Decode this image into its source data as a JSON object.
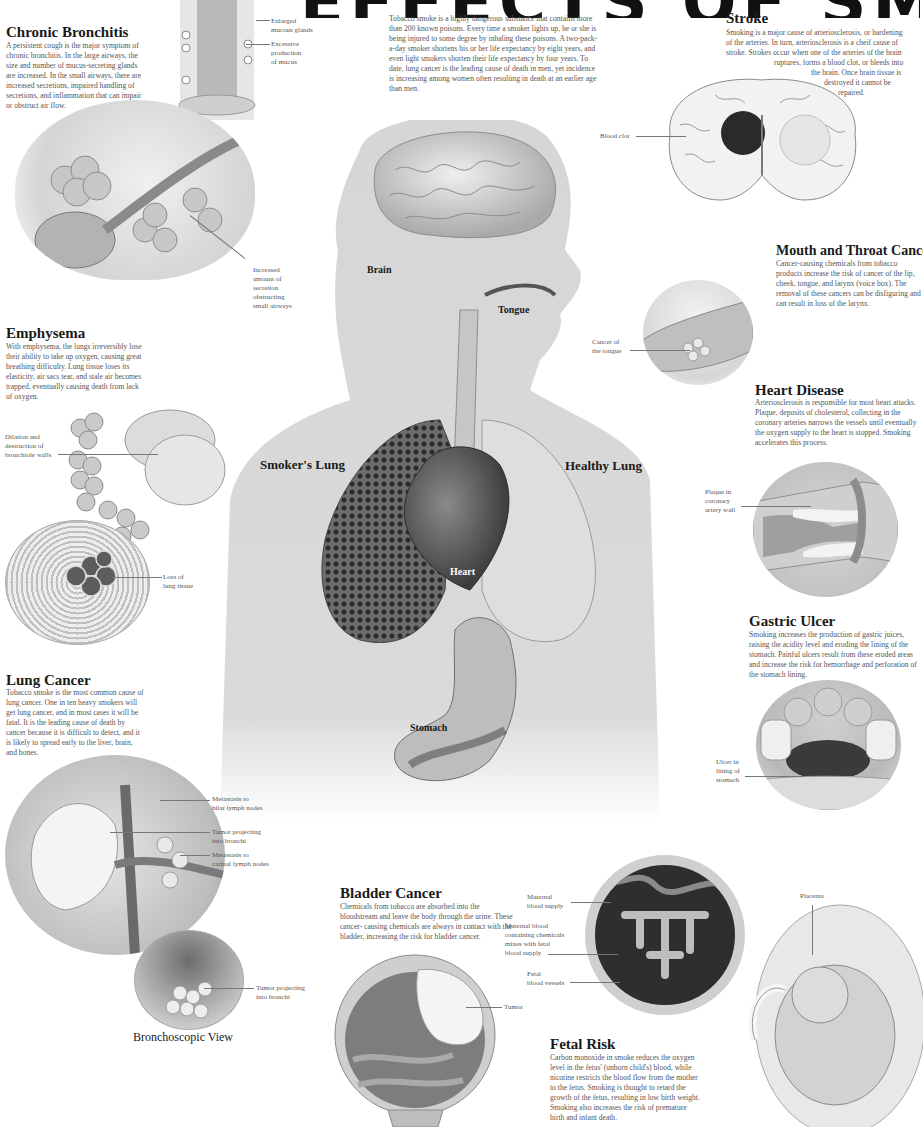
{
  "title": "EFFECTS OF SMOKING",
  "intro": "Tobacco smoke is a highly dangerous substance that contains more than 200 known poisons. Every time a smoker lights up, he or she is being injured to some degree by inhaling these poisons. A two-pack-a-day smoker shortens his or her life expectancy by eight years, and even light smokers shorten their life expectancy by four years. To date, lung cancer is the leading cause of death in men, yet incidence is increasing among women often resulting in death at an earlier age than men.",
  "sections": {
    "chronic_bronchitis": {
      "heading": "Chronic Bronchitis",
      "text": "A persistent cough is the major symptom of chronic bronchitis. In the large airways, the size and number of mucus-secreting glands are increased. In the small airways, there are increased secretions, impaired handling of secretions, and inflammation that can impair or obstruct air flow.",
      "callouts": [
        "Enlarged\nmucous glands",
        "Excessive\nproduction\nof mucus",
        "Increased\namount of\nsecretion\nobstructing\nsmall airways"
      ]
    },
    "emphysema": {
      "heading": "Emphysema",
      "text": "With emphysema, the lungs irreversibly lose their ability to take up oxygen, causing great breathing difficulty. Lung tissue loses its elasticity, air sacs tear, and stale air becomes trapped, eventually causing death from lack of oxygen.",
      "callouts": [
        "Dilation and\ndestruction of\nbronchiole walls",
        "Loss of\nlung tissue"
      ]
    },
    "lung_cancer": {
      "heading": "Lung Cancer",
      "text": "Tobacco smoke is the most common cause of lung cancer. One in ten heavy smokers will get lung cancer, and in most cases it will be fatal. It is the leading cause of death by cancer because it is difficult to detect, and it is likely to spread early to the liver, brain, and bones.",
      "callouts": [
        "Metastasis to\nhilar lymph nodes",
        "Tumor projecting\ninto bronchi",
        "Metastasis to\ncarinal lymph nodes",
        "Tumor projecting\ninto bronchi"
      ],
      "subheading": "Bronchoscopic View"
    },
    "stroke": {
      "heading": "Stroke",
      "text_lines": [
        "Smoking is a major cause of arteriosclerosis, or hardening",
        "of the arteries. In turn, arteriosclerosis is a cheif cause of",
        "stroke. Strokes occur when one of the arteries of the brain",
        "ruptures, forms a blood clot, or bleeds into",
        "the brain. Once brain tissue is",
        "destroyed it cannot be",
        "repaired."
      ],
      "callouts": [
        "Blood clot"
      ]
    },
    "mouth_throat_cancer": {
      "heading": "Mouth and Throat Cancer",
      "text": "Cancer-causing chemicals from tobacco products increase the risk of cancer of the lip, cheek, tongue, and larynx (voice box). The removal of these cancers can be disfiguring and can result in loss of the larynx.",
      "callouts": [
        "Cancer of\nthe tongue"
      ]
    },
    "heart_disease": {
      "heading": "Heart Disease",
      "text": "Arteriosclerosis is responsible for most heart attacks. Plaque, deposits of cholesterol, collecting in the coronary arteries narrows the vessels until eventually the oxygen supply to the heart is stopped. Smoking accelerates this process.",
      "callouts": [
        "Plaque in\ncoronary\nartery wall"
      ]
    },
    "gastric_ulcer": {
      "heading": "Gastric Ulcer",
      "text": "Smoking increases the production of gastric juices, raising the acidity level and eroding the lining of the stomach. Painful ulcers result from these eroded areas and increase the risk for hemorrhage and perforation of the stomach lining.",
      "callouts": [
        "Ulcer in\nlining of\nstomach"
      ]
    },
    "bladder_cancer": {
      "heading": "Bladder Cancer",
      "text": "Chemicals from tobacco are absorbed into the bloodstream and leave the body through the urine. These cancer- causing chemicals are always in contact with the bladder, increasing the risk for bladder cancer.",
      "callouts": [
        "Tumor"
      ]
    },
    "fetal_risk": {
      "heading": "Fetal Risk",
      "text": "Carbon monoxide in smoke reduces the oxygen level in the fetus' (unborn child's) blood, while nicotine restricts the blood flow from the mother to the fetus. Smoking is thought to retard the growth of the fetus, resulting in low birth weight. Smoking also increases the risk of premature birth and infant death.",
      "callouts": [
        "Maternal\nblood supply",
        "Maternal  blood\ncontaining chemicals\nmixes with fetal\nblood supply",
        "Fetal\nblood vessels",
        "Placenta"
      ]
    }
  },
  "body_labels": {
    "brain": "Brain",
    "tongue": "Tongue",
    "smokers_lung": "Smoker's Lung",
    "healthy_lung": "Healthy Lung",
    "heart": "Heart",
    "stomach": "Stomach"
  },
  "colors": {
    "heading": "#1a1a1a",
    "body_text": "#555555",
    "silhouette": "#d9d9d9",
    "tissue_dark": "#2a2a2a",
    "tissue_light": "#bdbdbd"
  }
}
